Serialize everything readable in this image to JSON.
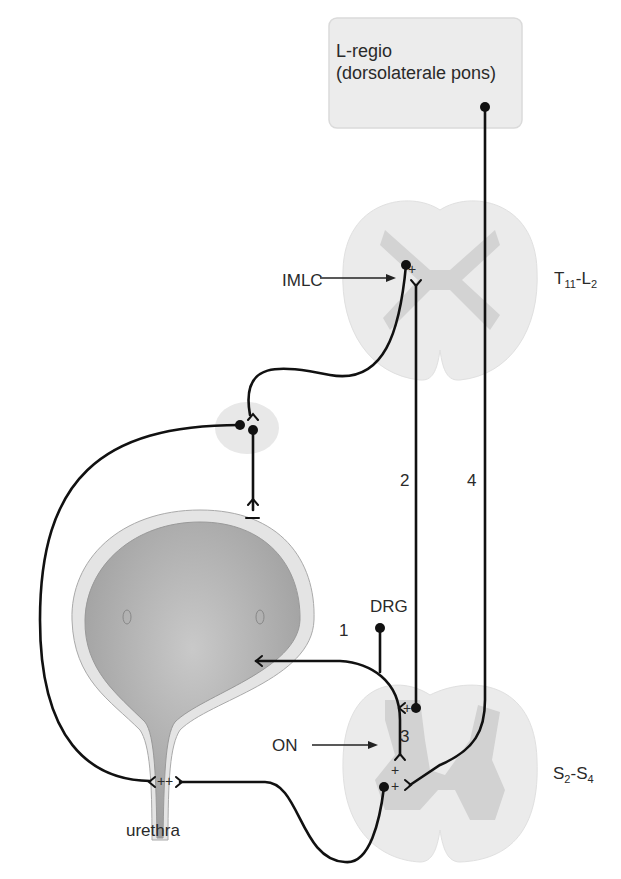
{
  "pons_box": {
    "line1": "L-regio",
    "line2": "(dorsolaterale pons)"
  },
  "levels": {
    "upper": {
      "main": "T",
      "sub1": "11",
      "sep": "-L",
      "sub2": "2"
    },
    "lower": {
      "main": "S",
      "sub1": "2",
      "sep": "-S",
      "sub2": "4"
    }
  },
  "labels": {
    "imlc": "IMLC",
    "drg": "DRG",
    "on": "ON",
    "urethra": "urethra"
  },
  "pathway_numbers": {
    "p1": "1",
    "p2": "2",
    "p3": "3",
    "p4": "4"
  },
  "signs": {
    "plus": "+",
    "minus": "−"
  },
  "colors": {
    "line": "#111111",
    "box_fill": "#ececec",
    "cord_white": "#ebebeb",
    "cord_grey": "#d2d2d2",
    "bladder_wall": "#e4e4e4",
    "bladder_lumen": "#b4b4b4"
  }
}
